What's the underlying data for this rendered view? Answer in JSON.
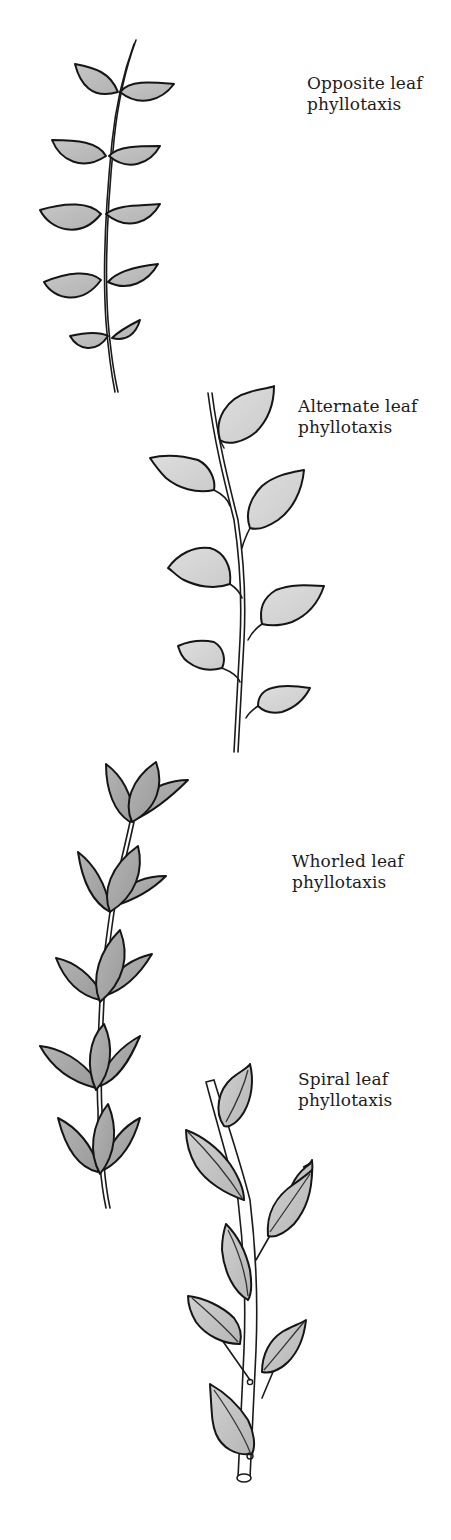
{
  "figure": {
    "colors": {
      "background": "#ffffff",
      "ink": "#151515",
      "opposite_leaf_fill": "#bdbdbd",
      "alternate_leaf_fill": "#d6d6d6",
      "whorled_leaf_fill": "#a9a9a9",
      "spiral_leaf_fill": "#c4c4c4"
    },
    "panels": [
      {
        "id": "opposite",
        "label_line1": "Opposite leaf",
        "label_line2": "phyllotaxis",
        "leaf_pairs": 5
      },
      {
        "id": "alternate",
        "label_line1": "Alternate leaf",
        "label_line2": "phyllotaxis",
        "leaves": 6
      },
      {
        "id": "whorled",
        "label_line1": "Whorled leaf",
        "label_line2": "phyllotaxis",
        "whorls": 5
      },
      {
        "id": "spiral",
        "label_line1": "Spiral leaf",
        "label_line2": "phyllotaxis",
        "leaves": 7
      }
    ]
  }
}
